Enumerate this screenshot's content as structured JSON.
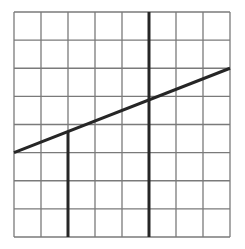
{
  "diagram": {
    "type": "grid-with-lines",
    "grid": {
      "columns": 8,
      "rows": 8,
      "left": 14,
      "top": 12,
      "right": 230,
      "bottom": 237,
      "line_color": "#7a7a7a",
      "line_width": 1.3
    },
    "lines": [
      {
        "name": "diagonal-line",
        "from_cell": [
          0,
          5.0
        ],
        "to_cell": [
          8,
          2.0
        ],
        "color": "#262626",
        "width": 3
      },
      {
        "name": "vertical-line-left",
        "from_cell": [
          2,
          4.25
        ],
        "to_cell": [
          2,
          8
        ],
        "color": "#262626",
        "width": 3
      },
      {
        "name": "vertical-line-right",
        "from_cell": [
          5,
          0
        ],
        "to_cell": [
          5,
          8
        ],
        "color": "#262626",
        "width": 3
      }
    ]
  }
}
